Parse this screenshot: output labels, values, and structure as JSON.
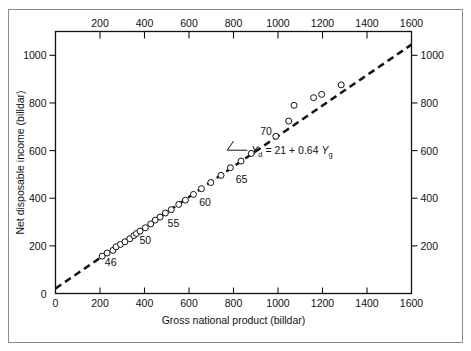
{
  "chart_data": {
    "type": "scatter",
    "title": "",
    "xlabel": "Gross national product (billdar)",
    "ylabel": "Net disposable income (billdar)",
    "xlim": [
      0,
      1600
    ],
    "ylim": [
      0,
      1100
    ],
    "grid": false,
    "legend_position": "none",
    "x_ticks_bottom": [
      "0",
      "200",
      "400",
      "600",
      "800",
      "1000",
      "1200",
      "1400",
      "1600"
    ],
    "x_ticks_top": [
      "200",
      "400",
      "600",
      "800",
      "1000",
      "1200",
      "1400",
      "1600"
    ],
    "y_ticks_left": [
      "0",
      "200",
      "400",
      "600",
      "800",
      "1000"
    ],
    "y_ticks_right": [
      "200",
      "400",
      "600",
      "800",
      "1000"
    ],
    "x_tick_values": [
      0,
      200,
      400,
      600,
      800,
      1000,
      1200,
      1400,
      1600
    ],
    "y_tick_values": [
      0,
      200,
      400,
      600,
      800,
      1000
    ],
    "marker": "open-circle",
    "fit_line": {
      "style": "dashed",
      "intercept": 21,
      "slope": 0.64,
      "equation": "Y  = 21 + 0.64 Y",
      "equation_lhs_symbol": "Y",
      "equation_lhs_sub": "d",
      "equation_rhs_symbol": "Y",
      "equation_rhs_sub": "g",
      "equation_full": "Y_d = 21 + 0.64 Y_g"
    },
    "annotations": [
      {
        "text": "46",
        "x": 248,
        "y": 116
      },
      {
        "text": "50",
        "x": 404,
        "y": 206
      },
      {
        "text": "55",
        "x": 530,
        "y": 278
      },
      {
        "text": "60",
        "x": 672,
        "y": 368
      },
      {
        "text": "65",
        "x": 836,
        "y": 466
      },
      {
        "text": "70",
        "x": 946,
        "y": 664
      }
    ],
    "series": [
      {
        "name": "Net disposable income vs GNP",
        "points": [
          {
            "x": 210,
            "y": 157
          },
          {
            "x": 232,
            "y": 170
          },
          {
            "x": 258,
            "y": 181
          },
          {
            "x": 272,
            "y": 196
          },
          {
            "x": 292,
            "y": 206
          },
          {
            "x": 312,
            "y": 217
          },
          {
            "x": 334,
            "y": 230
          },
          {
            "x": 352,
            "y": 243
          },
          {
            "x": 364,
            "y": 252
          },
          {
            "x": 380,
            "y": 262
          },
          {
            "x": 404,
            "y": 276
          },
          {
            "x": 428,
            "y": 292
          },
          {
            "x": 448,
            "y": 308
          },
          {
            "x": 470,
            "y": 321
          },
          {
            "x": 494,
            "y": 338
          },
          {
            "x": 520,
            "y": 352
          },
          {
            "x": 554,
            "y": 374
          },
          {
            "x": 584,
            "y": 392
          },
          {
            "x": 620,
            "y": 416
          },
          {
            "x": 656,
            "y": 440
          },
          {
            "x": 698,
            "y": 466
          },
          {
            "x": 744,
            "y": 496
          },
          {
            "x": 786,
            "y": 528
          },
          {
            "x": 834,
            "y": 556
          },
          {
            "x": 880,
            "y": 588
          },
          {
            "x": 990,
            "y": 660
          },
          {
            "x": 1048,
            "y": 724
          },
          {
            "x": 1072,
            "y": 790
          },
          {
            "x": 1160,
            "y": 822
          },
          {
            "x": 1196,
            "y": 836
          },
          {
            "x": 1284,
            "y": 876
          }
        ]
      }
    ]
  }
}
